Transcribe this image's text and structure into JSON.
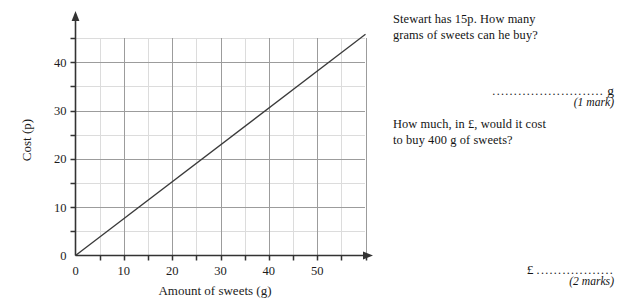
{
  "chart_data": {
    "type": "line",
    "title": "",
    "xlabel": "Amount of sweets (g)",
    "ylabel": "Cost (p)",
    "xlim": [
      0,
      60
    ],
    "ylim": [
      0,
      46
    ],
    "xticks": [
      0,
      10,
      20,
      30,
      40,
      50
    ],
    "yticks": [
      0,
      10,
      20,
      30,
      40
    ],
    "xtick_labels": [
      "0",
      "10",
      "20",
      "30",
      "40",
      "50"
    ],
    "ytick_labels": [
      "0",
      "10",
      "20",
      "30",
      "40"
    ],
    "minor_tick_step": 5,
    "grid": true,
    "grid_step_x": 5,
    "grid_step_y": 5,
    "legend": "none",
    "axis_arrows": true,
    "series": [
      {
        "name": "Cost of sweets",
        "x": [
          0,
          60
        ],
        "values": [
          0,
          45.8
        ],
        "slope_p_per_g": 0.763,
        "points": [
          {
            "x": 0,
            "y": 0
          },
          {
            "x": 10,
            "y": 7.6
          },
          {
            "x": 20,
            "y": 15.3
          },
          {
            "x": 30,
            "y": 22.9
          },
          {
            "x": 40,
            "y": 30.5
          },
          {
            "x": 50,
            "y": 38.2
          },
          {
            "x": 60,
            "y": 45.8
          }
        ]
      }
    ]
  },
  "question_one": {
    "text": "Stewart has 15p.  How many\ngrams of sweets can he buy?",
    "answer_line": "..........................",
    "answer_unit": "g",
    "marks": "(1 mark)"
  },
  "question_two": {
    "text": "How much, in £, would it cost\nto buy 400 g of sweets?",
    "currency_symbol": "£",
    "answer_line": "..................",
    "marks": "(2 marks)"
  },
  "colors": {
    "ink": "#1a1a1a",
    "axis": "#333333",
    "grid_major": "#9a9a9a",
    "grid_minor": "#d9d9d9",
    "plot_line": "#3a3a3a",
    "paper": "#ffffff"
  }
}
